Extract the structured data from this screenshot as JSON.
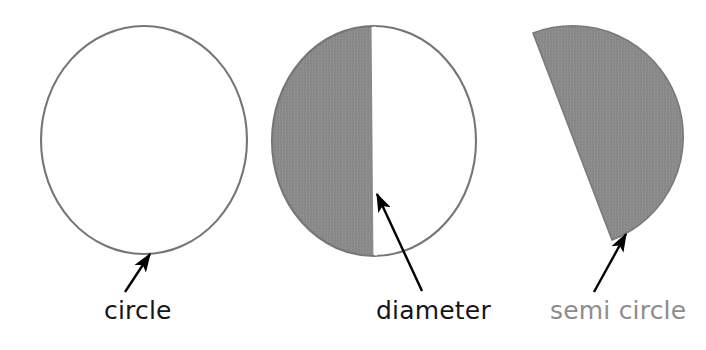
{
  "figure": {
    "background_color": "#ffffff",
    "shape_fill_color": "#8a8a8a",
    "shape_stroke_color": "#6e6e6e",
    "arrow_color": "#000000"
  },
  "shapes": [
    {
      "name": "circle",
      "kind": "circle-outline",
      "fill": "none",
      "stroke": "#767676",
      "center_x": 144,
      "center_y": 140,
      "radius_x": 103,
      "radius_y": 114
    },
    {
      "name": "circle-with-diameter",
      "kind": "circle-half-shaded",
      "fill": "#8a8a8a",
      "stroke": "#767676",
      "center_x": 374,
      "center_y": 141,
      "radius_x": 102,
      "radius_y": 115,
      "shaded_side": "left"
    },
    {
      "name": "semi-circle",
      "kind": "semi-circle",
      "fill": "#8a8a8a",
      "stroke": "#7a7a7a",
      "center_x": 573,
      "center_y": 137,
      "radius": 106,
      "rotation_degrees": 20,
      "shaded": true
    }
  ],
  "annotations": [
    {
      "name": "circle-annotation",
      "label": "circle",
      "label_color": "#161616",
      "arrow_from_x": 125,
      "arrow_from_y": 292,
      "arrow_to_x": 148,
      "arrow_to_y": 256
    },
    {
      "name": "diameter-annotation",
      "label": "diameter",
      "label_color": "#161616",
      "arrow_from_x": 420,
      "arrow_from_y": 291,
      "arrow_to_x": 377,
      "arrow_to_y": 196
    },
    {
      "name": "semi-circle-annotation",
      "label": "semi circle",
      "label_color": "#8d8d8d",
      "arrow_from_x": 595,
      "arrow_from_y": 292,
      "arrow_to_x": 624,
      "arrow_to_y": 236
    }
  ],
  "labels": {
    "circle": "circle",
    "diameter": "diameter",
    "semi_circle": "semi circle"
  }
}
